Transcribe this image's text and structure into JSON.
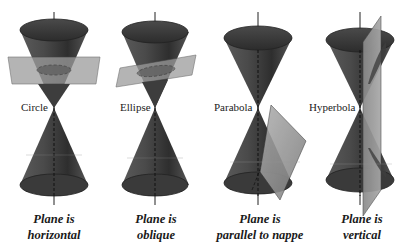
{
  "panels": [
    {
      "conic": "Circle",
      "caption_line1": "Plane is",
      "caption_line2": "horizontal"
    },
    {
      "conic": "Ellipse",
      "caption_line1": "Plane is",
      "caption_line2": "oblique"
    },
    {
      "conic": "Parabola",
      "caption_line1": "Plane is",
      "caption_line2": "parallel to nappe"
    },
    {
      "conic": "Hyperbola",
      "caption_line1": "Plane is",
      "caption_line2": "vertical"
    }
  ],
  "colors": {
    "cone_dark": "#3a3a3a",
    "cone_mid": "#6e6e6e",
    "plane": "#9a9a9a",
    "axis": "#222222"
  }
}
